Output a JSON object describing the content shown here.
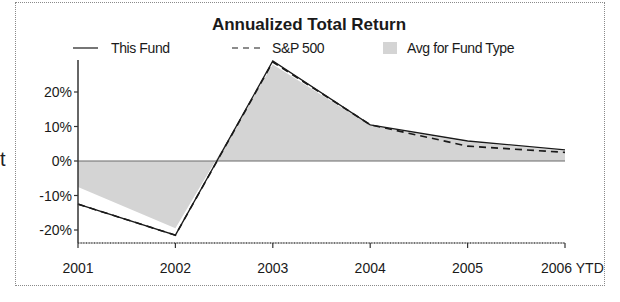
{
  "chart_data": {
    "type": "line",
    "title": "Annualized Total Return",
    "xlabel": "",
    "ylabel": "",
    "categories": [
      "2001",
      "2002",
      "2003",
      "2004",
      "2005",
      "2006 YTD"
    ],
    "series": [
      {
        "name": "This Fund",
        "style": "solid",
        "values": [
          -12.5,
          -21.5,
          29.0,
          10.5,
          5.8,
          3.2
        ]
      },
      {
        "name": "S&P 500",
        "style": "dashed",
        "values": [
          -12.5,
          -21.5,
          28.7,
          10.5,
          4.3,
          2.5
        ]
      },
      {
        "name": "Avg for Fund Type",
        "style": "area",
        "values": [
          -7.5,
          -19.5,
          28.0,
          10.3,
          5.5,
          3.0
        ]
      }
    ],
    "yticks": [
      "20%",
      "10%",
      "0%",
      "-10%",
      "-20%"
    ],
    "ytick_values": [
      20,
      10,
      0,
      -10,
      -20
    ],
    "ylim": [
      -23,
      30
    ],
    "grid": false,
    "legend_position": "top",
    "zero_line": true
  },
  "legend": {
    "fund": "This Fund",
    "sp500": "S&P 500",
    "avg": "Avg for Fund Type"
  },
  "stray_text": "t",
  "colors": {
    "line": "#1a1a1a",
    "area": "#d4d4d4",
    "zero_line": "#6a6a6a"
  }
}
